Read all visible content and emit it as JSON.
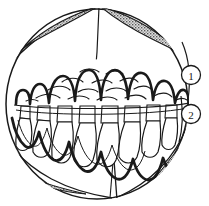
{
  "figure": {
    "type": "line-art-diagram",
    "background_color": "#ffffff",
    "line_color": "#1a1a1a",
    "fill_color": "#ffffff",
    "stipple_color": "#6b6b6b",
    "stipple_background": "#d9d9d9",
    "canvas": {
      "width": 209,
      "height": 206
    }
  },
  "callouts": [
    {
      "id": "callout-1",
      "label": "1",
      "cx": 191,
      "cy": 75,
      "r": 9.5,
      "description": "outer body wall layer"
    },
    {
      "id": "callout-2",
      "label": "2",
      "cx": 191,
      "cy": 114,
      "r": 9.5,
      "description": "inner tooth row layer"
    }
  ],
  "body_outline": {
    "name": "spherical-body-outline",
    "cx": 97,
    "cy": 104,
    "rx": 92,
    "ry": 96
  },
  "stipple_patches": [
    {
      "id": "stipple-top-left",
      "description": "upper left hatched lens segment"
    },
    {
      "id": "stipple-top-right",
      "description": "upper right hatched lens segment"
    },
    {
      "id": "stipple-bottom-left",
      "description": "lower left hatched lens segment"
    },
    {
      "id": "stipple-bottom-right",
      "description": "lower right hatched lens segment"
    }
  ],
  "structures": [
    {
      "id": "upper-tooth-row",
      "description": "upper arched row of conical teeth, bold outline"
    },
    {
      "id": "lower-tooth-row",
      "description": "lower wavy row of conical teeth, bold outline"
    },
    {
      "id": "palatal-rugae",
      "description": "field of small curved dash marks between tooth rows"
    },
    {
      "id": "apex-ridge",
      "description": "vertical ridge line from top apex"
    },
    {
      "id": "basal-ridge",
      "description": "vertical ridge line at bottom"
    }
  ]
}
